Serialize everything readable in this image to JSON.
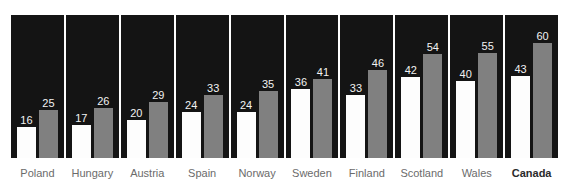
{
  "chart_data": {
    "type": "bar",
    "title": "",
    "subtitle": "",
    "xlabel": "",
    "ylabel": "",
    "ylim": [
      0,
      60
    ],
    "grid": false,
    "legend": "none",
    "orientation": "vertical",
    "categories": [
      "Poland",
      "Hungary",
      "Austria",
      "Spain",
      "Norway",
      "Sweden",
      "Finland",
      "Scotland",
      "Wales",
      "Canada"
    ],
    "series": [
      {
        "name": "first",
        "color": "#fdfdfd",
        "values": [
          16,
          17,
          20,
          24,
          24,
          36,
          33,
          42,
          40,
          43
        ]
      },
      {
        "name": "second",
        "color": "#808080",
        "values": [
          25,
          26,
          29,
          33,
          35,
          41,
          46,
          54,
          55,
          60
        ]
      }
    ],
    "panels": [
      {
        "category": "Poland",
        "highlight": false,
        "first": 16,
        "second": 25
      },
      {
        "category": "Hungary",
        "highlight": false,
        "first": 17,
        "second": 26
      },
      {
        "category": "Austria",
        "highlight": false,
        "first": 20,
        "second": 29
      },
      {
        "category": "Spain",
        "highlight": false,
        "first": 24,
        "second": 33
      },
      {
        "category": "Norway",
        "highlight": false,
        "first": 24,
        "second": 35
      },
      {
        "category": "Sweden",
        "highlight": false,
        "first": 36,
        "second": 41
      },
      {
        "category": "Finland",
        "highlight": false,
        "first": 33,
        "second": 46
      },
      {
        "category": "Scotland",
        "highlight": false,
        "first": 42,
        "second": 54
      },
      {
        "category": "Wales",
        "highlight": false,
        "first": 40,
        "second": 55
      },
      {
        "category": "Canada",
        "highlight": true,
        "first": 43,
        "second": 60
      }
    ],
    "panel_background": "#141414",
    "label_text_color": "#f2f2f2",
    "category_text_color": "#6b6b6b",
    "category_highlight_color": "#2a2a2a",
    "max_value": 60,
    "plot_height_px": 143
  }
}
